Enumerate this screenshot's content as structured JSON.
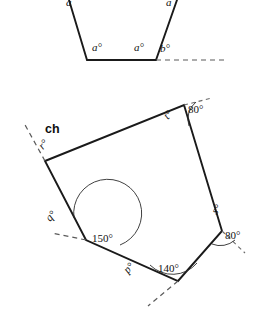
{
  "figure": {
    "background_color": "#ffffff",
    "line_color": "#1a1a1a",
    "dash_color": "#5a5a5a",
    "marker_label": "ch"
  },
  "top_shape": {
    "name": "partial-polygon-top",
    "description": "lower portion of a polygon cropped at top of image, with a dashed horizontal extension at the lower-right vertex",
    "labels": [
      {
        "id": "a-top-left",
        "text": "a",
        "x": 66,
        "y": 6
      },
      {
        "id": "a-top-right",
        "text": "a",
        "x": 166,
        "y": 6
      },
      {
        "id": "a-bottom-left",
        "text": "a°",
        "x": 92,
        "y": 51
      },
      {
        "id": "a-bottom-right",
        "text": "a°",
        "x": 134,
        "y": 51
      },
      {
        "id": "b-exterior",
        "text": "b°",
        "x": 160,
        "y": 52
      }
    ],
    "vertices": {
      "bottom_left": [
        87,
        60
      ],
      "bottom_right": [
        156,
        60
      ],
      "upper_left_cut": [
        69,
        0
      ],
      "upper_right_cut": [
        177,
        0
      ]
    },
    "dashed_extension": {
      "from": [
        156,
        60
      ],
      "to": [
        228,
        60
      ]
    }
  },
  "bottom_shape": {
    "name": "irregular-pentagon",
    "description": "irregular pentagon with labelled interior and exterior angles",
    "vertices": {
      "left_top": [
        45,
        161
      ],
      "top_right": [
        184,
        105
      ],
      "right": [
        222,
        231
      ],
      "bottom": [
        178,
        281
      ],
      "left_mid": [
        86,
        240
      ]
    },
    "angles": [
      {
        "id": "r",
        "text": "r°",
        "x": 43,
        "y": 150,
        "rotation": -48,
        "kind": "exterior"
      },
      {
        "id": "t",
        "text": "t°",
        "x": 168,
        "y": 120,
        "rotation": -48,
        "kind": "interior"
      },
      {
        "id": "angle-80-top",
        "text": "80°",
        "x": 188,
        "y": 113,
        "kind": "exterior",
        "value": 80
      },
      {
        "id": "s",
        "text": "s°",
        "x": 216,
        "y": 215,
        "rotation": -48,
        "kind": "exterior"
      },
      {
        "id": "angle-80-right",
        "text": "80°",
        "x": 231,
        "y": 237,
        "kind": "interior",
        "value": 80
      },
      {
        "id": "angle-140",
        "text": "140°",
        "x": 160,
        "y": 272,
        "kind": "interior",
        "value": 140
      },
      {
        "id": "p",
        "text": "p°",
        "x": 128,
        "y": 274,
        "rotation": -48,
        "kind": "exterior"
      },
      {
        "id": "q",
        "text": "q°",
        "x": 50,
        "y": 222,
        "rotation": -48,
        "kind": "exterior"
      },
      {
        "id": "angle-150",
        "text": "150°",
        "x": 96,
        "y": 237,
        "kind": "interior",
        "value": 150
      }
    ],
    "dashed_extensions": [
      {
        "id": "dash-r",
        "from": [
          45,
          161
        ],
        "to": [
          24,
          123
        ]
      },
      {
        "id": "dash-t-80",
        "from": [
          184,
          105
        ],
        "to": [
          212,
          98
        ]
      },
      {
        "id": "dash-s-80",
        "from": [
          222,
          231
        ],
        "to": [
          245,
          253
        ]
      },
      {
        "id": "dash-p",
        "from": [
          178,
          281
        ],
        "to": [
          148,
          306
        ]
      },
      {
        "id": "dash-q",
        "from": [
          86,
          240
        ],
        "to": [
          52,
          233
        ]
      }
    ]
  }
}
